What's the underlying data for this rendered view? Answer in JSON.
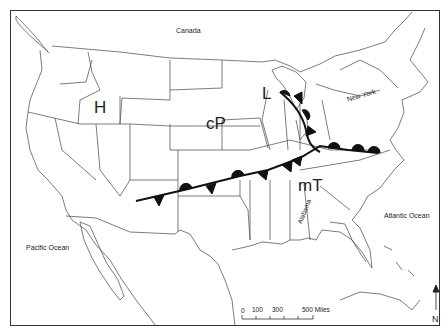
{
  "map": {
    "title": "",
    "labels": {
      "canada": "Canada",
      "pacific_ocean": "Pacific Ocean",
      "atlantic_ocean": "Atlantic Ocean",
      "new_york": "New York",
      "alabama": "Alabama"
    },
    "pressure_centers": {
      "high": "H",
      "low": "L"
    },
    "air_masses": {
      "continental_polar": "cP",
      "maritime_tropical": "mT"
    },
    "fronts": [
      {
        "type": "stationary",
        "description": "Stationary front from New Mexico across Oklahoma/Arkansas/Tennessee to Virginia coast"
      },
      {
        "type": "occluded/stationary",
        "description": "Front from low pressure over Wisconsin/Michigan down through Indiana/Ohio"
      }
    ],
    "scale_bar": {
      "ticks": [
        "0",
        "100",
        "300",
        "500 Miles"
      ]
    },
    "north_arrow": {
      "label": "N"
    },
    "colors": {
      "lines": "#333333",
      "front": "#111111",
      "background": "#ffffff"
    }
  }
}
